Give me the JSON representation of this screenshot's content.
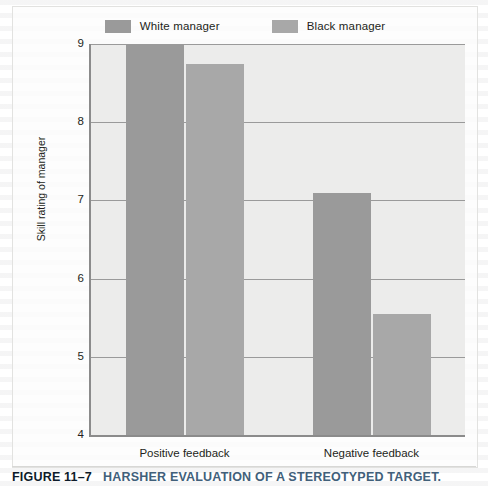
{
  "figure": {
    "caption_number": "FIGURE 11–7",
    "caption_title": "HARSHER EVALUATION OF A STEREOTYPED TARGET.",
    "caption_number_color": "#0d1b2a",
    "caption_title_color": "#41607a"
  },
  "chart_data": {
    "type": "bar",
    "title": "",
    "xlabel": "",
    "ylabel": "Skill rating of manager",
    "categories": [
      "Positive feedback",
      "Negative feedback"
    ],
    "series": [
      {
        "name": "White manager",
        "color": "#9a9a9a",
        "values": [
          9.0,
          7.1
        ]
      },
      {
        "name": "Black manager",
        "color": "#a8a8a8",
        "values": [
          8.74,
          5.55
        ]
      }
    ],
    "ylim": [
      4,
      9
    ],
    "yticks": [
      9,
      8,
      7,
      6,
      5,
      4
    ],
    "grid": true,
    "legend_position": "top",
    "plot_background": "#ececeb",
    "axis_color": "#8b8b8b",
    "gridline_color": "#9a9a9a"
  }
}
